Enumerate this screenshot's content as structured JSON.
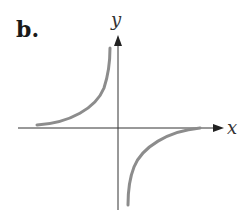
{
  "figure": {
    "panel_label": "b.",
    "x_axis_label": "x",
    "y_axis_label": "y",
    "colors": {
      "axis": "#333333",
      "curve": "#8c8c8c",
      "text": "#1a1a1a"
    }
  }
}
